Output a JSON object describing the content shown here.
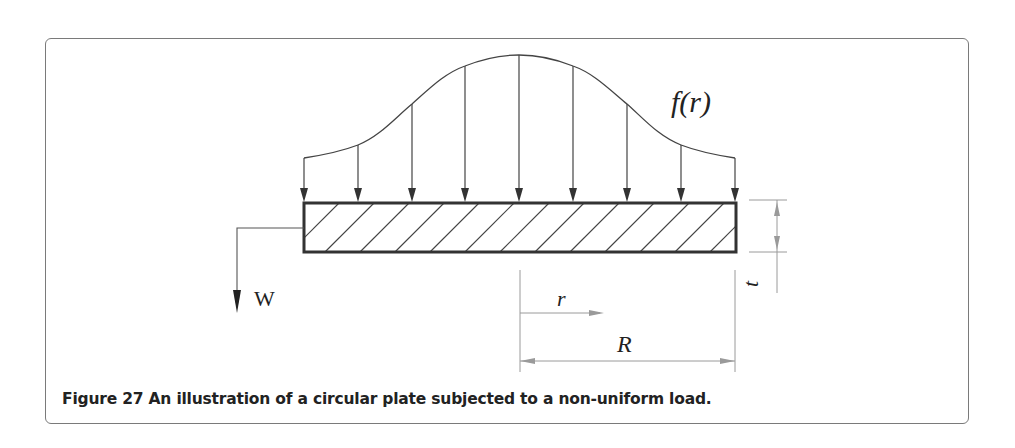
{
  "figure": {
    "caption": "Figure 27 An illustration of a circular plate subjected to a non-uniform load.",
    "labels": {
      "load_function": "f(r)",
      "deflection": "w",
      "radial_coordinate": "r",
      "radius": "R",
      "thickness": "t"
    },
    "load_arrows": {
      "count": 9,
      "x_positions": [
        304,
        358,
        412,
        465,
        519,
        573,
        627,
        681,
        735
      ],
      "curve_y": [
        158,
        145,
        104,
        66,
        55,
        66,
        104,
        145,
        158
      ]
    },
    "plate": {
      "x": 304,
      "y": 203,
      "width": 432,
      "height": 49,
      "hatch": "diagonal"
    },
    "colors": {
      "line": "#333333",
      "dimension": "#9a9a9a",
      "frame": "#7a7a7a",
      "text": "#222222"
    }
  }
}
